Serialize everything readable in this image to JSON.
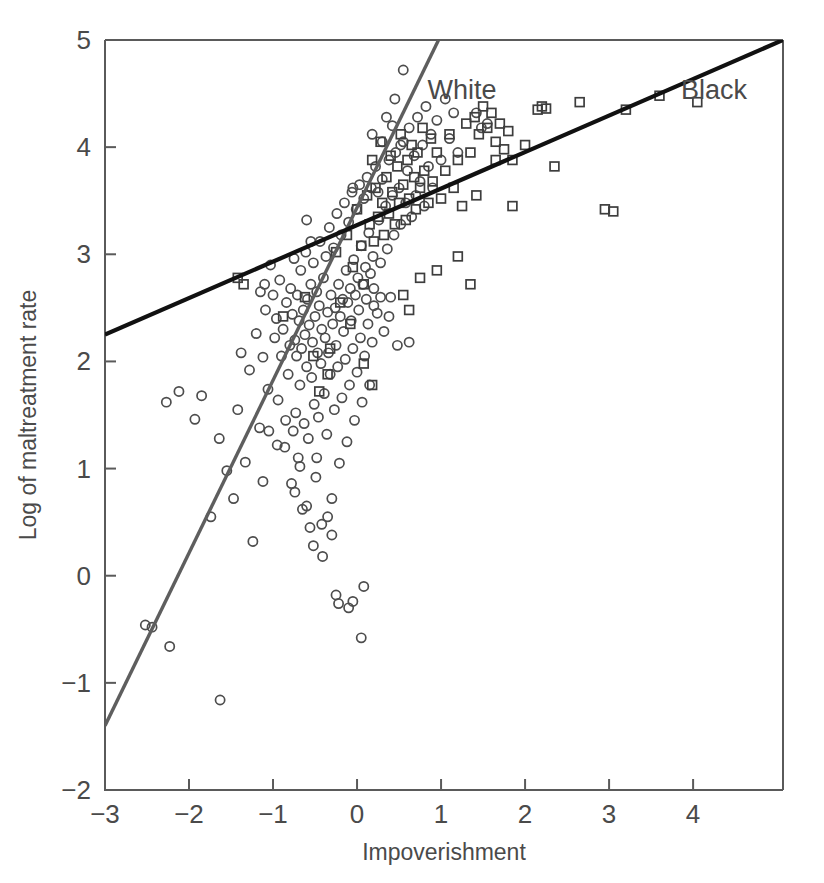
{
  "chart_data": {
    "type": "scatter",
    "title": "",
    "xlabel": "Impoverishment",
    "ylabel": "Log of maltreatment rate",
    "xlim": [
      -3,
      5.07
    ],
    "ylim": [
      -2,
      5
    ],
    "xticks": [
      -3,
      -2,
      -1,
      0,
      1,
      2,
      3,
      4
    ],
    "xtick_labels": [
      "−3",
      "−2",
      "−1",
      "0",
      "1",
      "2",
      "3",
      "4"
    ],
    "yticks": [
      -2,
      -1,
      0,
      1,
      2,
      3,
      4,
      5
    ],
    "ytick_labels": [
      "−2",
      "−1",
      "0",
      "1",
      "2",
      "3",
      "4",
      "5"
    ],
    "grid": false,
    "legend_position": "in-plot-annotation",
    "annotations": [
      {
        "text": "White",
        "x": 1.25,
        "y": 4.45
      },
      {
        "text": "Black",
        "x": 4.25,
        "y": 4.45
      }
    ],
    "series": [
      {
        "name": "White",
        "marker": "circle",
        "marker_color": "#4d4d4d",
        "fit_line": {
          "label": "White",
          "color": "#5e5e5e",
          "x": [
            -3.0,
            0.97
          ],
          "y": [
            -1.4,
            5.0
          ],
          "slope": 1.612,
          "intercept": 3.437
        },
        "points": [
          [
            -2.52,
            -0.46
          ],
          [
            -2.44,
            -0.48
          ],
          [
            -2.23,
            -0.66
          ],
          [
            -2.27,
            1.62
          ],
          [
            -2.12,
            1.72
          ],
          [
            -1.93,
            1.46
          ],
          [
            -1.85,
            1.68
          ],
          [
            -1.63,
            -1.16
          ],
          [
            -1.74,
            0.55
          ],
          [
            -1.64,
            1.28
          ],
          [
            -1.55,
            0.98
          ],
          [
            -1.47,
            0.72
          ],
          [
            -1.42,
            1.55
          ],
          [
            -1.38,
            2.08
          ],
          [
            -1.33,
            1.06
          ],
          [
            -1.28,
            1.92
          ],
          [
            -1.24,
            0.32
          ],
          [
            -1.2,
            2.26
          ],
          [
            -1.16,
            1.38
          ],
          [
            -1.12,
            2.04
          ],
          [
            -1.09,
            2.48
          ],
          [
            -1.06,
            1.74
          ],
          [
            -1.03,
            2.9
          ],
          [
            -1.0,
            2.62
          ],
          [
            -0.98,
            2.22
          ],
          [
            -0.96,
            2.4
          ],
          [
            -0.94,
            1.64
          ],
          [
            -0.92,
            2.76
          ],
          [
            -0.9,
            2.05
          ],
          [
            -0.88,
            2.3
          ],
          [
            -0.86,
            1.2
          ],
          [
            -0.84,
            2.55
          ],
          [
            -0.82,
            1.88
          ],
          [
            -0.8,
            2.15
          ],
          [
            -0.79,
            2.68
          ],
          [
            -0.78,
            0.86
          ],
          [
            -0.77,
            2.44
          ],
          [
            -0.76,
            1.35
          ],
          [
            -0.75,
            2.96
          ],
          [
            -0.74,
            2.2
          ],
          [
            -0.73,
            1.52
          ],
          [
            -0.72,
            2.05
          ],
          [
            -0.71,
            2.62
          ],
          [
            -0.7,
            1.1
          ],
          [
            -0.69,
            2.38
          ],
          [
            -0.68,
            1.78
          ],
          [
            -0.67,
            2.85
          ],
          [
            -0.66,
            2.12
          ],
          [
            -0.65,
            0.62
          ],
          [
            -0.64,
            2.48
          ],
          [
            -0.63,
            1.42
          ],
          [
            -0.62,
            2.25
          ],
          [
            -0.61,
            3.02
          ],
          [
            -0.6,
            1.95
          ],
          [
            -0.59,
            2.58
          ],
          [
            -0.58,
            1.28
          ],
          [
            -0.57,
            2.34
          ],
          [
            -0.56,
            0.45
          ],
          [
            -0.55,
            2.72
          ],
          [
            -0.54,
            1.85
          ],
          [
            -0.53,
            2.18
          ],
          [
            -0.52,
            2.92
          ],
          [
            -0.51,
            1.6
          ],
          [
            -0.5,
            2.42
          ],
          [
            -0.49,
            0.92
          ],
          [
            -0.48,
            2.65
          ],
          [
            -0.47,
            2.08
          ],
          [
            -0.46,
            1.48
          ],
          [
            -0.45,
            2.52
          ],
          [
            -0.44,
            3.12
          ],
          [
            -0.43,
            1.98
          ],
          [
            -0.42,
            2.3
          ],
          [
            -0.41,
            0.18
          ],
          [
            -0.4,
            2.78
          ],
          [
            -0.39,
            1.7
          ],
          [
            -0.38,
            2.22
          ],
          [
            -0.37,
            2.98
          ],
          [
            -0.36,
            1.32
          ],
          [
            -0.35,
            2.46
          ],
          [
            -0.34,
            2.08
          ],
          [
            -0.33,
            3.25
          ],
          [
            -0.32,
            1.88
          ],
          [
            -0.31,
            2.62
          ],
          [
            -0.3,
            0.72
          ],
          [
            -0.29,
            2.35
          ],
          [
            -0.28,
            3.06
          ],
          [
            -0.27,
            1.55
          ],
          [
            -0.26,
            2.5
          ],
          [
            -0.25,
            2.15
          ],
          [
            -0.24,
            3.38
          ],
          [
            -0.23,
            1.95
          ],
          [
            -0.22,
            2.72
          ],
          [
            -0.21,
            1.05
          ],
          [
            -0.2,
            2.42
          ],
          [
            -0.19,
            3.18
          ],
          [
            -0.18,
            1.66
          ],
          [
            -0.17,
            2.58
          ],
          [
            -0.16,
            2.28
          ],
          [
            -0.15,
            3.48
          ],
          [
            -0.14,
            2.02
          ],
          [
            -0.13,
            2.85
          ],
          [
            -0.12,
            1.25
          ],
          [
            -0.11,
            2.55
          ],
          [
            -0.1,
            3.3
          ],
          [
            -0.09,
            1.78
          ],
          [
            -0.08,
            2.68
          ],
          [
            -0.07,
            2.38
          ],
          [
            -0.06,
            3.58
          ],
          [
            -0.05,
            2.12
          ],
          [
            -0.04,
            2.95
          ],
          [
            -0.03,
            1.45
          ],
          [
            -0.02,
            2.62
          ],
          [
            -0.01,
            3.42
          ],
          [
            0.0,
            1.9
          ],
          [
            0.01,
            2.78
          ],
          [
            0.02,
            2.48
          ],
          [
            0.03,
            3.65
          ],
          [
            0.04,
            2.22
          ],
          [
            0.05,
            3.08
          ],
          [
            0.06,
            1.62
          ],
          [
            0.07,
            2.72
          ],
          [
            0.08,
            3.52
          ],
          [
            0.09,
            2.05
          ],
          [
            0.1,
            2.88
          ],
          [
            0.11,
            2.58
          ],
          [
            0.12,
            3.72
          ],
          [
            0.13,
            2.35
          ],
          [
            0.14,
            3.2
          ],
          [
            0.15,
            1.78
          ],
          [
            0.16,
            2.82
          ],
          [
            0.17,
            3.62
          ],
          [
            0.18,
            2.18
          ],
          [
            0.19,
            2.98
          ],
          [
            0.2,
            2.68
          ],
          [
            0.22,
            3.82
          ],
          [
            0.24,
            2.45
          ],
          [
            0.26,
            3.32
          ],
          [
            0.28,
            2.92
          ],
          [
            0.3,
            3.7
          ],
          [
            0.32,
            2.28
          ],
          [
            0.34,
            3.45
          ],
          [
            0.36,
            3.05
          ],
          [
            0.38,
            3.88
          ],
          [
            0.4,
            2.6
          ],
          [
            0.42,
            3.55
          ],
          [
            0.44,
            3.18
          ],
          [
            0.46,
            3.95
          ],
          [
            0.48,
            2.15
          ],
          [
            0.5,
            3.62
          ],
          [
            0.52,
            3.28
          ],
          [
            0.55,
            4.05
          ],
          [
            0.58,
            3.48
          ],
          [
            0.6,
            3.78
          ],
          [
            0.62,
            4.18
          ],
          [
            0.65,
            3.35
          ],
          [
            0.68,
            3.92
          ],
          [
            0.7,
            3.55
          ],
          [
            0.72,
            4.28
          ],
          [
            0.75,
            3.68
          ],
          [
            0.78,
            4.02
          ],
          [
            0.8,
            3.45
          ],
          [
            0.82,
            4.38
          ],
          [
            0.85,
            3.82
          ],
          [
            0.88,
            4.12
          ],
          [
            0.9,
            3.62
          ],
          [
            0.95,
            4.25
          ],
          [
            1.0,
            3.88
          ],
          [
            1.05,
            4.45
          ],
          [
            1.1,
            4.08
          ],
          [
            1.15,
            4.32
          ],
          [
            1.2,
            3.95
          ],
          [
            0.55,
            4.72
          ],
          [
            0.45,
            4.45
          ],
          [
            0.42,
            4.2
          ],
          [
            0.52,
            4.02
          ],
          [
            0.35,
            4.28
          ],
          [
            0.3,
            4.05
          ],
          [
            0.25,
            3.58
          ],
          [
            0.18,
            4.12
          ],
          [
            -0.05,
            3.62
          ],
          [
            -0.6,
            3.32
          ],
          [
            -0.55,
            3.12
          ],
          [
            -1.1,
            2.72
          ],
          [
            -1.15,
            2.65
          ],
          [
            0.62,
            2.18
          ],
          [
            0.28,
            2.6
          ],
          [
            0.38,
            2.42
          ],
          [
            0.2,
            2.52
          ],
          [
            -0.3,
            0.38
          ],
          [
            -0.25,
            -0.18
          ],
          [
            -0.22,
            -0.26
          ],
          [
            -0.1,
            -0.3
          ],
          [
            -0.05,
            -0.24
          ],
          [
            0.05,
            -0.58
          ],
          [
            0.08,
            -0.1
          ],
          [
            -0.35,
            0.55
          ],
          [
            -0.42,
            0.48
          ],
          [
            -0.52,
            0.28
          ],
          [
            -0.6,
            0.65
          ],
          [
            -0.48,
            1.1
          ],
          [
            -0.68,
            1.02
          ],
          [
            -0.74,
            0.78
          ],
          [
            -0.85,
            1.45
          ],
          [
            -0.95,
            1.22
          ],
          [
            -1.05,
            1.35
          ],
          [
            -1.12,
            0.88
          ],
          [
            1.42,
            4.32
          ],
          [
            1.48,
            4.18
          ],
          [
            1.55,
            4.22
          ]
        ]
      },
      {
        "name": "Black",
        "marker": "square",
        "marker_color": "#3d3d3d",
        "fit_line": {
          "label": "Black",
          "color": "#111111",
          "x": [
            -3.0,
            5.07
          ],
          "y": [
            2.25,
            5.0
          ],
          "slope": 0.341,
          "intercept": 3.273
        },
        "points": [
          [
            -1.42,
            2.78
          ],
          [
            -1.35,
            2.72
          ],
          [
            -0.88,
            2.42
          ],
          [
            -0.52,
            2.05
          ],
          [
            -0.45,
            1.72
          ],
          [
            -0.32,
            2.12
          ],
          [
            -0.25,
            3.02
          ],
          [
            -0.2,
            2.55
          ],
          [
            -0.12,
            3.18
          ],
          [
            -0.05,
            2.88
          ],
          [
            0.0,
            3.42
          ],
          [
            0.05,
            3.08
          ],
          [
            0.08,
            2.72
          ],
          [
            0.12,
            3.55
          ],
          [
            0.15,
            3.28
          ],
          [
            0.18,
            3.88
          ],
          [
            0.2,
            3.12
          ],
          [
            0.22,
            3.62
          ],
          [
            0.25,
            3.35
          ],
          [
            0.28,
            4.05
          ],
          [
            0.3,
            3.48
          ],
          [
            0.32,
            3.18
          ],
          [
            0.35,
            3.72
          ],
          [
            0.38,
            3.38
          ],
          [
            0.4,
            3.92
          ],
          [
            0.42,
            3.58
          ],
          [
            0.45,
            3.28
          ],
          [
            0.48,
            3.82
          ],
          [
            0.5,
            3.48
          ],
          [
            0.52,
            4.12
          ],
          [
            0.55,
            3.65
          ],
          [
            0.58,
            3.32
          ],
          [
            0.6,
            3.88
          ],
          [
            0.62,
            3.52
          ],
          [
            0.65,
            4.02
          ],
          [
            0.68,
            3.72
          ],
          [
            0.7,
            3.42
          ],
          [
            0.72,
            3.95
          ],
          [
            0.75,
            3.62
          ],
          [
            0.78,
            4.18
          ],
          [
            0.8,
            3.78
          ],
          [
            0.85,
            3.48
          ],
          [
            0.88,
            4.08
          ],
          [
            0.9,
            3.68
          ],
          [
            0.95,
            3.95
          ],
          [
            1.0,
            3.52
          ],
          [
            1.05,
            3.78
          ],
          [
            1.1,
            4.12
          ],
          [
            1.15,
            3.62
          ],
          [
            1.2,
            3.88
          ],
          [
            1.25,
            3.45
          ],
          [
            1.3,
            4.22
          ],
          [
            1.35,
            3.95
          ],
          [
            1.4,
            4.28
          ],
          [
            1.45,
            4.12
          ],
          [
            1.5,
            4.38
          ],
          [
            1.55,
            4.18
          ],
          [
            1.6,
            4.32
          ],
          [
            1.65,
            4.05
          ],
          [
            1.7,
            4.22
          ],
          [
            1.75,
            3.98
          ],
          [
            1.8,
            4.15
          ],
          [
            1.85,
            3.88
          ],
          [
            1.2,
            2.98
          ],
          [
            1.35,
            2.72
          ],
          [
            0.55,
            2.62
          ],
          [
            0.75,
            2.78
          ],
          [
            0.62,
            2.48
          ],
          [
            0.95,
            2.85
          ],
          [
            1.42,
            3.55
          ],
          [
            1.65,
            3.88
          ],
          [
            2.0,
            4.02
          ],
          [
            2.15,
            4.35
          ],
          [
            2.2,
            4.38
          ],
          [
            2.25,
            4.36
          ],
          [
            2.35,
            3.82
          ],
          [
            2.65,
            4.42
          ],
          [
            2.95,
            3.42
          ],
          [
            3.05,
            3.4
          ],
          [
            3.2,
            4.35
          ],
          [
            3.6,
            4.48
          ],
          [
            4.05,
            4.42
          ],
          [
            1.85,
            3.45
          ],
          [
            -0.62,
            2.6
          ],
          [
            -0.35,
            1.88
          ],
          [
            0.18,
            1.78
          ],
          [
            -0.08,
            2.35
          ],
          [
            0.08,
            1.98
          ]
        ]
      }
    ]
  },
  "labels": {
    "x_axis_title": "Impoverishment",
    "y_axis_title": "Log of maltreatment rate",
    "white_label": "White",
    "black_label": "Black"
  }
}
